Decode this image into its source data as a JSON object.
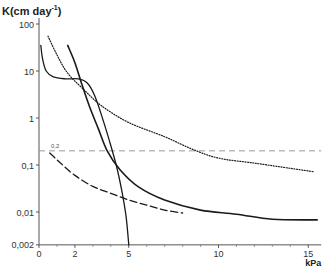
{
  "chart_data": {
    "type": "line",
    "title": "",
    "ylabel": "K (cm day-1)",
    "ylabel_main": "K(cm day",
    "ylabel_exp": "-1",
    "ylabel_close": ")",
    "xlabel": "kPa",
    "yscale": "log",
    "ylim": [
      0.002,
      100
    ],
    "xlim": [
      0,
      15.5
    ],
    "y_ticks": [
      {
        "value": 100,
        "label": "100"
      },
      {
        "value": 10,
        "label": "10"
      },
      {
        "value": 1,
        "label": "1"
      },
      {
        "value": 0.1,
        "label": "0,1"
      },
      {
        "value": 0.01,
        "label": "0,01"
      },
      {
        "value": 0.002,
        "label": "0,002"
      }
    ],
    "x_ticks": [
      {
        "value": 0,
        "label": "0"
      },
      {
        "value": 2,
        "label": "2"
      },
      {
        "value": 5,
        "label": "5"
      },
      {
        "value": 10,
        "label": "10"
      },
      {
        "value": 15,
        "label": "15"
      }
    ],
    "x_minor_ticks": [
      1,
      3,
      4,
      6,
      7,
      8,
      9,
      11,
      12,
      13,
      14
    ],
    "grid": false,
    "legend": null,
    "annotations": [
      {
        "type": "hline",
        "y": 0.2,
        "label": "0,2",
        "style": "dashed",
        "color": "#999999"
      }
    ],
    "series": [
      {
        "name": "curve-a-solid-sigmoid",
        "style": "solid",
        "width": 1.3,
        "points": [
          [
            0.1,
            35
          ],
          [
            0.2,
            18
          ],
          [
            0.4,
            10
          ],
          [
            0.8,
            7.5
          ],
          [
            1.5,
            6.8
          ],
          [
            2.2,
            6.8
          ],
          [
            2.7,
            5.5
          ],
          [
            3.1,
            3
          ],
          [
            3.5,
            1.1
          ],
          [
            3.9,
            0.35
          ],
          [
            4.3,
            0.1
          ],
          [
            4.6,
            0.03
          ],
          [
            4.85,
            0.008
          ],
          [
            5.0,
            0.002
          ]
        ]
      },
      {
        "name": "curve-b-solid-steep",
        "style": "solid",
        "width": 1.6,
        "points": [
          [
            1.6,
            35
          ],
          [
            2.0,
            15
          ],
          [
            2.4,
            5
          ],
          [
            2.8,
            1.8
          ],
          [
            3.3,
            0.6
          ],
          [
            3.8,
            0.2
          ],
          [
            4.5,
            0.08
          ],
          [
            5.5,
            0.035
          ],
          [
            7,
            0.018
          ],
          [
            9,
            0.011
          ],
          [
            11,
            0.009
          ],
          [
            13,
            0.007
          ],
          [
            15.5,
            0.0068
          ]
        ]
      },
      {
        "name": "curve-c-dotted",
        "style": "dotted",
        "width": 1.2,
        "points": [
          [
            0.5,
            55
          ],
          [
            1.0,
            22
          ],
          [
            1.6,
            9
          ],
          [
            2.5,
            4
          ],
          [
            3.5,
            1.8
          ],
          [
            5,
            0.8
          ],
          [
            7,
            0.4
          ],
          [
            8.5,
            0.22
          ],
          [
            10,
            0.14
          ],
          [
            12,
            0.11
          ],
          [
            14,
            0.085
          ],
          [
            15.3,
            0.072
          ]
        ]
      },
      {
        "name": "curve-d-dashed",
        "style": "dashed",
        "width": 1.3,
        "points": [
          [
            0.6,
            0.18
          ],
          [
            1.2,
            0.11
          ],
          [
            2,
            0.06
          ],
          [
            3,
            0.035
          ],
          [
            4,
            0.025
          ],
          [
            5,
            0.018
          ],
          [
            6,
            0.014
          ],
          [
            7,
            0.011
          ],
          [
            8,
            0.0095
          ]
        ]
      }
    ]
  }
}
